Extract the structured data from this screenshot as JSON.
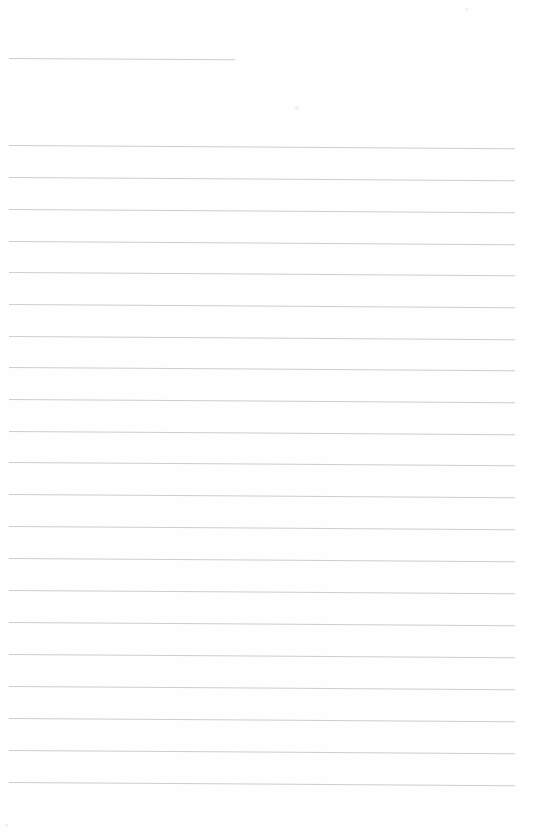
{
  "document": {
    "kind": "scanned-lined-paper",
    "page_width": 547,
    "page_height": 832,
    "background_color": "#ffffff",
    "paper_tone": "#fefefe",
    "content_text": "",
    "written_text": "",
    "notes_label": "",
    "rule_color": "#c9cacd",
    "rule_count": 22,
    "rule_spacing_px": 31.9,
    "rule_tilt_degrees": 0.34,
    "rule_left_x": 9,
    "rule_right_x": 515,
    "margins": {
      "top_blank_px": 58,
      "bottom_blank_px": 49
    }
  },
  "rules": [
    {
      "id": "rule-1",
      "y": 58,
      "x": 9,
      "width": 226,
      "tilt": 0.3,
      "weight": 1.0,
      "kind": "short"
    },
    {
      "id": "rule-2",
      "y": 145,
      "x": 9,
      "width": 506,
      "tilt": 0.36,
      "weight": 1.0,
      "kind": "full"
    },
    {
      "id": "rule-3",
      "y": 177,
      "x": 9,
      "width": 506,
      "tilt": 0.36,
      "weight": 1.0,
      "kind": "full"
    },
    {
      "id": "rule-4",
      "y": 209,
      "x": 9,
      "width": 506,
      "tilt": 0.36,
      "weight": 1.0,
      "kind": "full"
    },
    {
      "id": "rule-5",
      "y": 241,
      "x": 9,
      "width": 506,
      "tilt": 0.36,
      "weight": 1.0,
      "kind": "full"
    },
    {
      "id": "rule-6",
      "y": 272,
      "x": 9,
      "width": 506,
      "tilt": 0.36,
      "weight": 1.0,
      "kind": "full"
    },
    {
      "id": "rule-7",
      "y": 304,
      "x": 9,
      "width": 506,
      "tilt": 0.36,
      "weight": 1.0,
      "kind": "full"
    },
    {
      "id": "rule-8",
      "y": 336,
      "x": 9,
      "width": 506,
      "tilt": 0.36,
      "weight": 1.0,
      "kind": "full"
    },
    {
      "id": "rule-9",
      "y": 367,
      "x": 9,
      "width": 506,
      "tilt": 0.36,
      "weight": 1.0,
      "kind": "full"
    },
    {
      "id": "rule-10",
      "y": 399,
      "x": 9,
      "width": 506,
      "tilt": 0.36,
      "weight": 1.0,
      "kind": "full"
    },
    {
      "id": "rule-11",
      "y": 431,
      "x": 9,
      "width": 506,
      "tilt": 0.36,
      "weight": 1.0,
      "kind": "full"
    },
    {
      "id": "rule-12",
      "y": 462,
      "x": 9,
      "width": 506,
      "tilt": 0.36,
      "weight": 1.0,
      "kind": "full"
    },
    {
      "id": "rule-13",
      "y": 494,
      "x": 9,
      "width": 506,
      "tilt": 0.36,
      "weight": 1.0,
      "kind": "full"
    },
    {
      "id": "rule-14",
      "y": 526,
      "x": 9,
      "width": 506,
      "tilt": 0.36,
      "weight": 1.0,
      "kind": "full"
    },
    {
      "id": "rule-15",
      "y": 558,
      "x": 9,
      "width": 506,
      "tilt": 0.36,
      "weight": 1.0,
      "kind": "full"
    },
    {
      "id": "rule-16",
      "y": 590,
      "x": 9,
      "width": 506,
      "tilt": 0.36,
      "weight": 1.0,
      "kind": "full"
    },
    {
      "id": "rule-17",
      "y": 622,
      "x": 9,
      "width": 506,
      "tilt": 0.36,
      "weight": 1.0,
      "kind": "full"
    },
    {
      "id": "rule-18",
      "y": 654,
      "x": 9,
      "width": 506,
      "tilt": 0.36,
      "weight": 1.0,
      "kind": "full"
    },
    {
      "id": "rule-19",
      "y": 686,
      "x": 9,
      "width": 506,
      "tilt": 0.36,
      "weight": 1.0,
      "kind": "full"
    },
    {
      "id": "rule-20",
      "y": 718,
      "x": 9,
      "width": 506,
      "tilt": 0.36,
      "weight": 1.0,
      "kind": "full"
    },
    {
      "id": "rule-21",
      "y": 750,
      "x": 9,
      "width": 506,
      "tilt": 0.36,
      "weight": 1.0,
      "kind": "full"
    },
    {
      "id": "rule-22",
      "y": 782,
      "x": 9,
      "width": 506,
      "tilt": 0.36,
      "weight": 1.0,
      "kind": "full"
    }
  ],
  "specks": [
    {
      "id": "speck-1",
      "x": 465,
      "y": 8,
      "size": 3
    },
    {
      "id": "speck-2",
      "x": 295,
      "y": 106,
      "size": 4
    },
    {
      "id": "speck-3",
      "x": 5,
      "y": 824,
      "size": 3
    }
  ]
}
